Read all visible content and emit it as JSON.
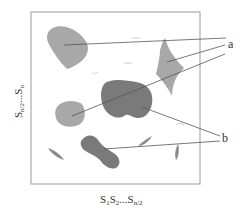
{
  "diagram": {
    "labels": {
      "a": "a",
      "b": "b"
    },
    "axes": {
      "x_label_parts": [
        "S",
        "1",
        "S",
        "2",
        "...S",
        "n/2"
      ],
      "y_label_parts": [
        "S",
        "n/2",
        "...S",
        "n"
      ]
    },
    "colors": {
      "light_region": "#a8a8a8",
      "dark_region": "#7a7a7a",
      "frame": "#9a9a9a",
      "leader_line": "#555555",
      "text": "#333333"
    },
    "regions": [
      {
        "id": "a1",
        "type": "a",
        "description": "top-left light blob"
      },
      {
        "id": "a2",
        "type": "a",
        "description": "right diamond light region"
      },
      {
        "id": "a3",
        "type": "a",
        "description": "left-middle light blob"
      },
      {
        "id": "b1",
        "type": "b",
        "description": "center dark blob"
      },
      {
        "id": "b2",
        "type": "b",
        "description": "bottom dark bone-shaped blob"
      }
    ]
  }
}
